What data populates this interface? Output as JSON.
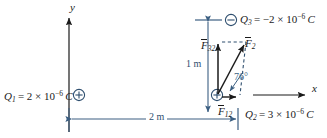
{
  "figure": {
    "kind": "physics-force-vector-diagram",
    "width": 327,
    "height": 138,
    "background_color": "#ffffff"
  },
  "colors": {
    "ink": "#1a1a1a",
    "dimension_blue": "#3c5f82",
    "charge_circle": "#2f4f6f",
    "construction_dash": "#2f4f6f"
  },
  "axes": {
    "y_label": "y",
    "x_label": "x"
  },
  "charges": [
    {
      "id": "Q1",
      "name": "Q",
      "subscript": "1",
      "sign": "+",
      "sign_glyph": "⊕",
      "value_text": "= 2 × 10",
      "exponent": "−6",
      "unit": "C",
      "label": "Q₁ = 2 × 10⁻⁶ C"
    },
    {
      "id": "Q3",
      "name": "Q",
      "subscript": "3",
      "sign": "−",
      "sign_glyph": "⊖",
      "value_text": "= −2 × 10",
      "exponent": "−6",
      "unit": "C",
      "label": "Q₃ = −2 × 10⁻⁶ C"
    },
    {
      "id": "Q2",
      "name": "Q",
      "subscript": "2",
      "sign": "+",
      "sign_glyph": "⊕",
      "value_text": "= 3 × 10",
      "exponent": "−6",
      "unit": "C",
      "label": "Q₂ = 3 × 10⁻⁶ C"
    }
  ],
  "vectors": [
    {
      "id": "F32",
      "name": "F",
      "subscript": "32",
      "direction": "up",
      "overbar": true
    },
    {
      "id": "F2",
      "name": "F",
      "subscript": "2",
      "direction": "up-right",
      "overbar": true
    },
    {
      "id": "F12",
      "name": "F",
      "subscript": "12",
      "direction": "right",
      "overbar": true
    }
  ],
  "angle": {
    "value": "76",
    "unit": "°",
    "label": "76°"
  },
  "dimensions": [
    {
      "id": "vertical",
      "label": "1 m",
      "orientation": "vertical"
    },
    {
      "id": "horizontal",
      "label": "2 m",
      "orientation": "horizontal"
    }
  ]
}
